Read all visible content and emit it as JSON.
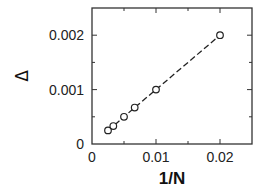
{
  "chart_data": {
    "type": "scatter",
    "title": "",
    "xlabel": "1/N",
    "ylabel": "Δ",
    "xlim": [
      0,
      0.025
    ],
    "ylim": [
      0,
      0.0025
    ],
    "x_ticks": [
      0,
      0.01,
      0.02
    ],
    "x_tick_labels": [
      "0",
      "0.01",
      "0.02"
    ],
    "x_minor_ticks": [
      0.005,
      0.015
    ],
    "y_ticks": [
      0,
      0.001,
      0.002
    ],
    "y_tick_labels": [
      "0",
      "0.001",
      "0.002"
    ],
    "y_minor_ticks": [
      0.0005,
      0.0015
    ],
    "grid": false,
    "legend": null,
    "series": [
      {
        "name": "data",
        "marker": "open-circle",
        "line": "dashed",
        "x": [
          0.0025,
          0.00333,
          0.005,
          0.00667,
          0.01,
          0.02
        ],
        "y": [
          0.00025,
          0.00033,
          0.0005,
          0.00067,
          0.001,
          0.002
        ]
      }
    ]
  },
  "layout": {
    "plot_left": 92,
    "plot_top": 8,
    "plot_right": 252,
    "plot_bottom": 144,
    "colors": {
      "axis": "#333333",
      "line": "#222222",
      "marker": "#222222"
    }
  }
}
